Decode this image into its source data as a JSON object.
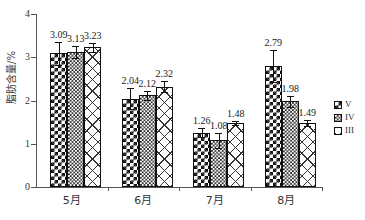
{
  "chart_data": {
    "type": "bar",
    "title": "",
    "xlabel": "",
    "ylabel": "脂肪含量/%",
    "ylim": [
      0,
      4
    ],
    "ytick_labels": [
      "4",
      "3",
      "2",
      "1",
      "0"
    ],
    "ytick_values": [
      4,
      3,
      2,
      1,
      0
    ],
    "grid": false,
    "legend_position": "right",
    "categories": [
      "5月",
      "6月",
      "7月",
      "8月"
    ],
    "series": [
      {
        "name": "V",
        "pattern": "dense-checkerboard",
        "values": [
          3.09,
          2.04,
          1.26,
          2.79
        ],
        "labels": [
          "3.09",
          "2.04",
          "1.26",
          "2.79"
        ],
        "errors": [
          0.27,
          0.24,
          0.11,
          0.37
        ]
      },
      {
        "name": "IV",
        "pattern": "fine-checkerboard",
        "values": [
          3.13,
          2.12,
          1.08,
          1.98
        ],
        "labels": [
          "3.13",
          "2.12",
          "1.08",
          "1.98"
        ],
        "errors": [
          0.14,
          0.11,
          0.17,
          0.13
        ]
      },
      {
        "name": "III",
        "pattern": "diagonal-crosshatch",
        "values": [
          3.23,
          2.32,
          1.48,
          1.49
        ],
        "labels": [
          "3.23",
          "2.32",
          "1.48",
          "1.49"
        ],
        "errors": [
          0.1,
          0.13,
          0.05,
          0.07
        ]
      }
    ]
  },
  "legend": {
    "items": [
      {
        "label": "V"
      },
      {
        "label": "IV"
      },
      {
        "label": "III"
      }
    ]
  },
  "colors": {
    "axis": "#555555",
    "ink": "#111111",
    "text": "#333333",
    "background": "#ffffff"
  }
}
